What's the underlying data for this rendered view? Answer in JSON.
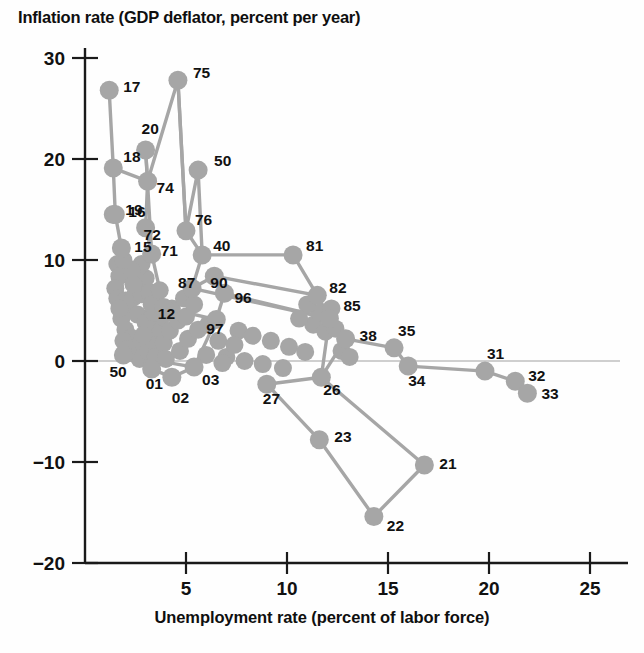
{
  "chart_data": {
    "type": "scatter",
    "title": "Inflation rate (GDP deflator, percent per year)",
    "xlabel": "Unemployment rate (percent of labor force)",
    "ylabel": "Inflation rate (GDP deflator, percent per year)",
    "xlim": [
      0,
      26.5
    ],
    "ylim": [
      -20,
      32
    ],
    "xticks": [
      5,
      10,
      15,
      20,
      25
    ],
    "yticks": [
      30,
      20,
      10,
      0,
      -10,
      -20
    ],
    "grid": false,
    "legend": null,
    "zero_line": true,
    "marker_color": "#a6a6a6",
    "line_color": "#a6a6a6",
    "connected": true,
    "annotation_note": "Points are connected chronologically by year; labels are two-digit years.",
    "points": [
      {
        "label": "17",
        "x": 1.2,
        "y": 26.8
      },
      {
        "label": "18",
        "x": 1.4,
        "y": 19.1
      },
      {
        "label": "19",
        "x": 1.4,
        "y": 14.5
      },
      {
        "label": "16",
        "x": 1.5,
        "y": 14.5
      },
      {
        "label": "15",
        "x": 1.8,
        "y": 11.2
      },
      {
        "label": "20",
        "x": 3.0,
        "y": 20.9
      },
      {
        "label": "74",
        "x": 3.1,
        "y": 17.8
      },
      {
        "label": "72",
        "x": 3.0,
        "y": 13.2
      },
      {
        "label": "71",
        "x": 3.3,
        "y": 10.6
      },
      {
        "label": "75",
        "x": 4.6,
        "y": 27.8
      },
      {
        "label": "76",
        "x": 5.0,
        "y": 12.9
      },
      {
        "label": "50",
        "x": 5.6,
        "y": 18.9
      },
      {
        "label": "40",
        "x": 5.8,
        "y": 10.5
      },
      {
        "label": "87",
        "x": 5.3,
        "y": 7.2
      },
      {
        "label": "90",
        "x": 6.4,
        "y": 8.4
      },
      {
        "label": "96",
        "x": 6.9,
        "y": 6.7
      },
      {
        "label": "97",
        "x": 6.5,
        "y": 4.1
      },
      {
        "label": "12",
        "x": 3.9,
        "y": 5.3
      },
      {
        "label": "81",
        "x": 10.3,
        "y": 10.5
      },
      {
        "label": "82",
        "x": 11.5,
        "y": 6.5
      },
      {
        "label": "85",
        "x": 12.1,
        "y": 4.2
      },
      {
        "label": "38",
        "x": 12.9,
        "y": 2.2
      },
      {
        "label": "35",
        "x": 15.3,
        "y": 1.3
      },
      {
        "label": "34",
        "x": 16.0,
        "y": -0.5
      },
      {
        "label": "31",
        "x": 19.8,
        "y": -1.0
      },
      {
        "label": "32",
        "x": 21.3,
        "y": -2.0
      },
      {
        "label": "33",
        "x": 21.9,
        "y": -3.2
      },
      {
        "label": "26",
        "x": 11.7,
        "y": -1.6
      },
      {
        "label": "27",
        "x": 9.0,
        "y": -2.3
      },
      {
        "label": "23",
        "x": 11.6,
        "y": -7.8
      },
      {
        "label": "22",
        "x": 14.3,
        "y": -15.4
      },
      {
        "label": "21",
        "x": 16.8,
        "y": -10.3
      },
      {
        "label": "01",
        "x": 3.3,
        "y": -0.8
      },
      {
        "label": "02",
        "x": 4.3,
        "y": -1.6
      },
      {
        "label": "03",
        "x": 5.4,
        "y": -0.6
      },
      {
        "label": "1950s",
        "x": 1.9,
        "y": 0.6
      }
    ]
  },
  "labels": {
    "17": "17",
    "18": "18",
    "16": "16",
    "15": "15",
    "20": "20",
    "74": "74",
    "72": "72",
    "71": "71",
    "75": "75",
    "76": "76",
    "50a": "50",
    "40": "40",
    "87": "87",
    "90": "90",
    "96": "96",
    "97": "97",
    "12": "12",
    "81": "81",
    "82": "82",
    "85": "85",
    "38": "38",
    "35": "35",
    "34": "34",
    "31": "31",
    "32": "32",
    "33": "33",
    "26": "26",
    "27": "27",
    "23": "23",
    "22": "22",
    "21": "21",
    "01": "01",
    "02": "02",
    "03": "03",
    "50b": "50"
  }
}
